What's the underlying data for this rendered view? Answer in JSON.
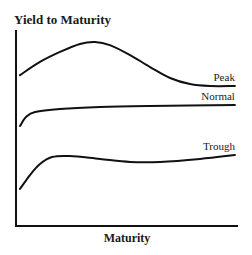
{
  "chart_data": {
    "type": "line",
    "title": "",
    "ylabel": "Yield to Maturity",
    "xlabel": "Maturity",
    "xlim": [
      0,
      100
    ],
    "ylim": [
      0,
      100
    ],
    "grid": false,
    "ticks": false,
    "legend": "inline labels at right end of each curve",
    "series": [
      {
        "name": "Peak",
        "points": [
          [
            1.8,
            77.0
          ],
          [
            10.8,
            83.7
          ],
          [
            19.8,
            88.8
          ],
          [
            28.8,
            92.9
          ],
          [
            35.6,
            93.9
          ],
          [
            42.3,
            92.3
          ],
          [
            51.4,
            87.2
          ],
          [
            60.4,
            81.1
          ],
          [
            69.4,
            75.5
          ],
          [
            78.4,
            72.4
          ],
          [
            87.4,
            71.4
          ],
          [
            98.6,
            71.4
          ]
        ]
      },
      {
        "name": "Normal",
        "points": [
          [
            1.8,
            51.0
          ],
          [
            4.5,
            55.6
          ],
          [
            8.6,
            58.2
          ],
          [
            19.8,
            59.7
          ],
          [
            37.8,
            60.7
          ],
          [
            60.4,
            61.2
          ],
          [
            98.6,
            61.7
          ]
        ]
      },
      {
        "name": "Trough",
        "points": [
          [
            1.8,
            18.9
          ],
          [
            6.3,
            26.0
          ],
          [
            10.8,
            31.6
          ],
          [
            16.2,
            35.2
          ],
          [
            24.3,
            35.7
          ],
          [
            37.8,
            34.2
          ],
          [
            51.4,
            32.7
          ],
          [
            64.9,
            32.7
          ],
          [
            82.9,
            34.2
          ],
          [
            98.6,
            36.2
          ]
        ]
      }
    ]
  }
}
